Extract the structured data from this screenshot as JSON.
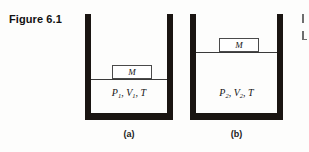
{
  "figure": {
    "title": "Figure 6.1",
    "background_color": "#fdfdfc",
    "wall_color": "#1a1512",
    "line_color": "#3a3a3a"
  },
  "panels": [
    {
      "id": "a",
      "caption": "(a)",
      "mass_label": "M",
      "gas_state": {
        "pressure": "P",
        "pressure_sub": "1",
        "volume": "V",
        "volume_sub": "2",
        "temperature": "T",
        "full_text": "P1, V1, T",
        "sep1": ", ",
        "sep2": ", "
      }
    },
    {
      "id": "b",
      "caption": "(b)",
      "mass_label": "M",
      "gas_state": {
        "pressure": "P",
        "pressure_sub": "2",
        "volume": "V",
        "volume_sub": "2",
        "temperature": "T",
        "full_text": "P2, V2, T",
        "sep1": ", ",
        "sep2": ", "
      }
    }
  ]
}
